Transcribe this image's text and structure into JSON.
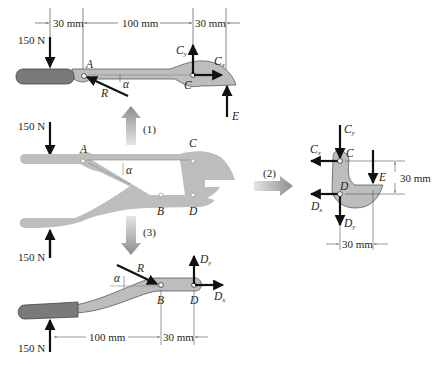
{
  "colors": {
    "part": "#bdbdbd",
    "part_faded": "#d4d4d4",
    "grip": "#7a7a7a",
    "outline": "#5a5a5a",
    "force": "#111111",
    "dim": "#555555",
    "flow_arrow": "#9a9a9a"
  },
  "top_fbd": {
    "force_left": "150 N",
    "dims": [
      "30 mm",
      "100 mm",
      "30 mm"
    ],
    "labels": {
      "A": "A",
      "C": "C",
      "R": "R",
      "alpha": "α",
      "E": "E"
    },
    "forces": {
      "Cy": "C",
      "Cy_sub": "y",
      "Cx": "C",
      "Cx_sub": "x"
    }
  },
  "assembly": {
    "force_top": "150 N",
    "force_bottom": "150 N",
    "labels": {
      "A": "A",
      "B": "B",
      "C": "C",
      "D": "D",
      "alpha": "α"
    }
  },
  "flow_arrows": {
    "up": "(1)",
    "right": "(2)",
    "down": "(3)"
  },
  "jaw_fbd": {
    "labels": {
      "C": "C",
      "D": "D",
      "E": "E"
    },
    "forces": {
      "Cy": "C",
      "Cy_sub": "y",
      "Cx": "C",
      "Cx_sub": "x",
      "Dx": "D",
      "Dx_sub": "x",
      "Dy": "D",
      "Dy_sub": "y"
    },
    "dim_vertical": "30 mm",
    "dim_horizontal": "30 mm"
  },
  "bottom_fbd": {
    "force_left": "150 N",
    "dims": [
      "100 mm",
      "30 mm"
    ],
    "labels": {
      "B": "B",
      "D": "D",
      "R": "R",
      "alpha": "α"
    },
    "forces": {
      "Dy": "D",
      "Dy_sub": "y",
      "Dx": "D",
      "Dx_sub": "x"
    }
  }
}
